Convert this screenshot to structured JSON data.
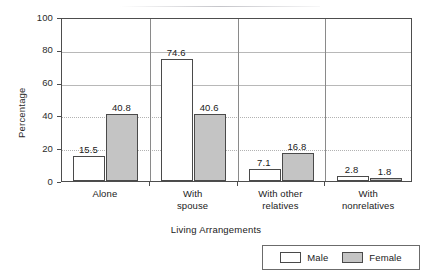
{
  "chart_data": {
    "type": "bar",
    "title": "",
    "subtitle": "",
    "xlabel": "Living Arrangements",
    "ylabel": "Percentage",
    "categories": [
      "Alone",
      "With spouse",
      "With other relatives",
      "With nonrelatives"
    ],
    "category_lines": [
      [
        "Alone"
      ],
      [
        "With",
        "spouse"
      ],
      [
        "With other",
        "relatives"
      ],
      [
        "With",
        "nonrelatives"
      ]
    ],
    "series": [
      {
        "name": "Male",
        "values": [
          15.5,
          74.6,
          7.1,
          2.8
        ],
        "color": "#ffffff"
      },
      {
        "name": "Female",
        "values": [
          40.8,
          40.6,
          16.8,
          1.8
        ],
        "color": "#c4c4c4"
      }
    ],
    "value_labels": [
      [
        "15.5",
        "40.8"
      ],
      [
        "74.6",
        "40.6"
      ],
      [
        "7.1",
        "16.8"
      ],
      [
        "2.8",
        "1.8"
      ]
    ],
    "ylim": [
      0,
      100
    ],
    "yticks": [
      0,
      20,
      40,
      60,
      80,
      100
    ],
    "ytick_labels": [
      "0",
      "20",
      "40",
      "60",
      "80",
      "100"
    ],
    "grid": true,
    "grid_axis": "y",
    "legend": {
      "position": "bottom-right",
      "entries": [
        {
          "label": "Male",
          "swatch": "white-bar-swatch"
        },
        {
          "label": "Female",
          "swatch": "gray-bar-swatch"
        }
      ]
    }
  },
  "colors": {
    "male_fill": "#ffffff",
    "female_fill": "#c4c4c4",
    "bar_outline": "#4a4a4a",
    "axis": "#4d4d4d",
    "gridline": "#b2b2b2",
    "text": "#212121"
  }
}
